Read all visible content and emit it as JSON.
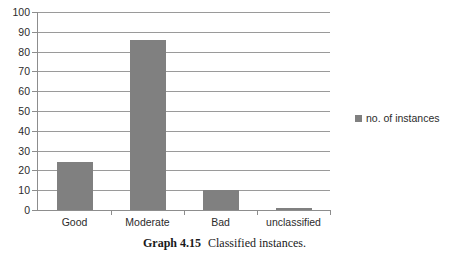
{
  "chart_data": {
    "type": "bar",
    "title": "",
    "subtitle": "",
    "xlabel": "",
    "ylabel": "",
    "categories": [
      "Good",
      "Moderate",
      "Bad",
      "unclassified"
    ],
    "values": [
      24,
      86,
      10,
      1
    ],
    "series": [
      {
        "name": "no. of instances",
        "values": [
          24,
          86,
          10,
          1
        ]
      }
    ],
    "ylim": [
      0,
      100
    ],
    "yticks": [
      0,
      10,
      20,
      30,
      40,
      50,
      60,
      70,
      80,
      90,
      100
    ],
    "ytick_labels": [
      "0",
      "10",
      "20",
      "30",
      "40",
      "50",
      "60",
      "70",
      "80",
      "90",
      "100"
    ],
    "grid": "horizontal",
    "legend_position": "right",
    "bar_color": "#808080",
    "gridline_color": "#9a9a9a",
    "axis_color": "#8d8d8d",
    "text_color": "#2b2b2b"
  },
  "legend": {
    "entries": [
      {
        "label": "no. of instances",
        "color": "#808080"
      }
    ]
  },
  "caption": {
    "number": "Graph 4.15",
    "text": "Classified instances."
  }
}
